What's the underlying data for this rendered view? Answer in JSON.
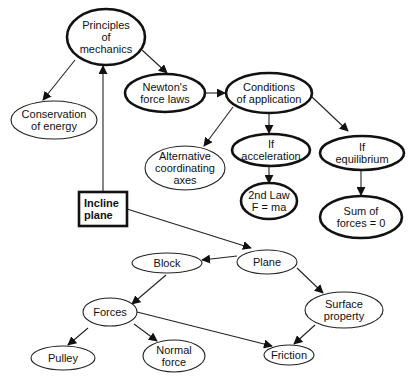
{
  "diagram": {
    "type": "concept-map",
    "nodes": [
      {
        "id": "principles",
        "lines": [
          "Principles",
          "of",
          "mechanics"
        ],
        "shape": "ellipse",
        "style": "thick",
        "cx": 106,
        "cy": 37,
        "rx": 39,
        "ry": 28
      },
      {
        "id": "conservation",
        "lines": [
          "Conservation",
          "of energy"
        ],
        "shape": "ellipse",
        "style": "thin",
        "cx": 54,
        "cy": 120,
        "rx": 43,
        "ry": 19
      },
      {
        "id": "newton",
        "lines": [
          "Newton's",
          "force laws"
        ],
        "shape": "ellipse",
        "style": "thick",
        "cx": 165,
        "cy": 93,
        "rx": 40,
        "ry": 19
      },
      {
        "id": "conditions",
        "lines": [
          "Conditions",
          "of application"
        ],
        "shape": "ellipse",
        "style": "thick",
        "cx": 269,
        "cy": 93,
        "rx": 43,
        "ry": 20
      },
      {
        "id": "alternative",
        "lines": [
          "Alternative",
          "coordinating",
          "axes"
        ],
        "shape": "ellipse",
        "style": "thin",
        "cx": 185,
        "cy": 168,
        "rx": 40,
        "ry": 22
      },
      {
        "id": "if_accel",
        "lines": [
          "If",
          "acceleration"
        ],
        "shape": "ellipse",
        "style": "thick",
        "cx": 271,
        "cy": 150,
        "rx": 39,
        "ry": 16
      },
      {
        "id": "if_equil",
        "lines": [
          "If",
          "equilibrium"
        ],
        "shape": "ellipse",
        "style": "thick",
        "cx": 362,
        "cy": 153,
        "rx": 42,
        "ry": 17
      },
      {
        "id": "second_law",
        "lines": [
          "2nd Law",
          "F = ma"
        ],
        "shape": "ellipse",
        "style": "thick",
        "cx": 269,
        "cy": 201,
        "rx": 28,
        "ry": 18
      },
      {
        "id": "sum_forces",
        "lines": [
          "Sum of",
          "forces = 0"
        ],
        "shape": "ellipse",
        "style": "thick",
        "cx": 361,
        "cy": 217,
        "rx": 41,
        "ry": 21
      },
      {
        "id": "incline",
        "lines": [
          "Incline",
          "plane"
        ],
        "shape": "rect",
        "style": "thick",
        "x": 79,
        "y": 192,
        "w": 48,
        "h": 34
      },
      {
        "id": "block",
        "lines": [
          "Block"
        ],
        "shape": "ellipse",
        "style": "thin",
        "cx": 167,
        "cy": 263,
        "rx": 35,
        "ry": 10
      },
      {
        "id": "plane",
        "lines": [
          "Plane"
        ],
        "shape": "ellipse",
        "style": "thin",
        "cx": 267,
        "cy": 262,
        "rx": 30,
        "ry": 12
      },
      {
        "id": "forces",
        "lines": [
          "Forces"
        ],
        "shape": "ellipse",
        "style": "thin",
        "cx": 110,
        "cy": 312,
        "rx": 27,
        "ry": 14
      },
      {
        "id": "surface",
        "lines": [
          "Surface",
          "property"
        ],
        "shape": "ellipse",
        "style": "thin",
        "cx": 344,
        "cy": 310,
        "rx": 39,
        "ry": 18
      },
      {
        "id": "pulley",
        "lines": [
          "Pulley"
        ],
        "shape": "ellipse",
        "style": "thin",
        "cx": 63,
        "cy": 358,
        "rx": 32,
        "ry": 12
      },
      {
        "id": "normal",
        "lines": [
          "Normal",
          "force"
        ],
        "shape": "ellipse",
        "style": "thin",
        "cx": 174,
        "cy": 356,
        "rx": 31,
        "ry": 16
      },
      {
        "id": "friction",
        "lines": [
          "Friction"
        ],
        "shape": "ellipse",
        "style": "thin",
        "cx": 289,
        "cy": 355,
        "rx": 25,
        "ry": 10
      }
    ],
    "edges": [
      {
        "from": "principles",
        "to": "conservation",
        "x1": 75,
        "y1": 60,
        "x2": 43,
        "y2": 100
      },
      {
        "from": "principles",
        "to": "newton",
        "x1": 142,
        "y1": 50,
        "x2": 167,
        "y2": 73
      },
      {
        "from": "incline",
        "to": "principles",
        "x1": 103,
        "y1": 192,
        "x2": 103,
        "y2": 66
      },
      {
        "from": "newton",
        "to": "conditions",
        "x1": 205,
        "y1": 93,
        "x2": 225,
        "y2": 93
      },
      {
        "from": "conditions",
        "to": "alternative",
        "x1": 233,
        "y1": 107,
        "x2": 204,
        "y2": 146
      },
      {
        "from": "conditions",
        "to": "if_accel",
        "x1": 269,
        "y1": 113,
        "x2": 269,
        "y2": 133
      },
      {
        "from": "conditions",
        "to": "if_equil",
        "x1": 312,
        "y1": 97,
        "x2": 348,
        "y2": 131
      },
      {
        "from": "if_accel",
        "to": "second_law",
        "x1": 269,
        "y1": 166,
        "x2": 269,
        "y2": 183
      },
      {
        "from": "if_equil",
        "to": "sum_forces",
        "x1": 361,
        "y1": 170,
        "x2": 361,
        "y2": 195
      },
      {
        "from": "incline",
        "to": "plane",
        "x1": 127,
        "y1": 209,
        "x2": 251,
        "y2": 248
      },
      {
        "from": "plane",
        "to": "block",
        "x1": 237,
        "y1": 256,
        "x2": 202,
        "y2": 260
      },
      {
        "from": "plane",
        "to": "surface",
        "x1": 297,
        "y1": 268,
        "x2": 323,
        "y2": 293
      },
      {
        "from": "block",
        "to": "forces",
        "x1": 166,
        "y1": 275,
        "x2": 132,
        "y2": 304
      },
      {
        "from": "forces",
        "to": "friction",
        "x1": 137,
        "y1": 312,
        "x2": 272,
        "y2": 346
      },
      {
        "from": "forces",
        "to": "pulley",
        "x1": 88,
        "y1": 328,
        "x2": 68,
        "y2": 345
      },
      {
        "from": "forces",
        "to": "normal",
        "x1": 134,
        "y1": 324,
        "x2": 157,
        "y2": 341
      },
      {
        "from": "surface",
        "to": "friction",
        "x1": 315,
        "y1": 325,
        "x2": 294,
        "y2": 344
      }
    ]
  }
}
